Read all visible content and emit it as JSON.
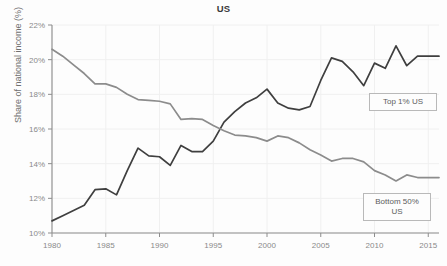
{
  "chart_data": {
    "type": "line",
    "title": "US",
    "xlabel": "",
    "ylabel": "Share of national income (%)",
    "xlim": [
      1980,
      2016
    ],
    "ylim": [
      10,
      22
    ],
    "xticks": [
      1980,
      1985,
      1990,
      1995,
      2000,
      2005,
      2010,
      2015
    ],
    "xtick_labels": [
      "1980",
      "1985",
      "1990",
      "1995",
      "2000",
      "2005",
      "2010",
      "2015"
    ],
    "yticks": [
      10,
      12,
      14,
      16,
      18,
      20,
      22
    ],
    "ytick_labels": [
      "10%",
      "12%",
      "14%",
      "16%",
      "18%",
      "20%",
      "22%"
    ],
    "grid": true,
    "legend_position": "inline-labels",
    "x": [
      1980,
      1981,
      1982,
      1983,
      1984,
      1985,
      1986,
      1987,
      1988,
      1989,
      1990,
      1991,
      1992,
      1993,
      1994,
      1995,
      1996,
      1997,
      1998,
      1999,
      2000,
      2001,
      2002,
      2003,
      2004,
      2005,
      2006,
      2007,
      2008,
      2009,
      2010,
      2011,
      2012,
      2013,
      2014,
      2015,
      2016
    ],
    "series": [
      {
        "name": "Top 1% US",
        "color": "#3f3f3f",
        "label": "Top 1% US",
        "values": [
          10.7,
          11.0,
          11.3,
          11.6,
          12.5,
          12.55,
          12.2,
          13.6,
          14.9,
          14.45,
          14.4,
          13.9,
          15.05,
          14.7,
          14.7,
          15.3,
          16.4,
          17.0,
          17.5,
          17.8,
          18.3,
          17.5,
          17.2,
          17.1,
          17.3,
          18.8,
          20.1,
          19.9,
          19.3,
          18.5,
          19.8,
          19.5,
          20.8,
          19.65,
          20.2,
          20.2,
          20.2
        ]
      },
      {
        "name": "Bottom 50% US",
        "color": "#8c8c8c",
        "label": "Bottom 50% US",
        "values": [
          20.6,
          20.2,
          19.7,
          19.2,
          18.6,
          18.6,
          18.4,
          18.0,
          17.7,
          17.65,
          17.6,
          17.45,
          16.55,
          16.6,
          16.55,
          16.2,
          15.9,
          15.65,
          15.6,
          15.5,
          15.3,
          15.6,
          15.5,
          15.2,
          14.8,
          14.5,
          14.15,
          14.3,
          14.3,
          14.1,
          13.6,
          13.35,
          13.0,
          13.35,
          13.2,
          13.2,
          13.2
        ]
      }
    ]
  },
  "legend": {
    "top1_label": "Top 1% US",
    "bottom50_line1": "Bottom 50%",
    "bottom50_line2": "US"
  }
}
